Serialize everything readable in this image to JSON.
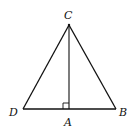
{
  "diagram": {
    "type": "geometry-triangle",
    "points": {
      "C": {
        "label": "C",
        "x": 69,
        "y": 25
      },
      "D": {
        "label": "D",
        "x": 23,
        "y": 109
      },
      "B": {
        "label": "B",
        "x": 116,
        "y": 109
      },
      "A": {
        "label": "A",
        "x": 69,
        "y": 109
      }
    },
    "segments": [
      "CD",
      "CB",
      "DB",
      "CA"
    ],
    "right_angle_at": "A",
    "stroke_color": "#111111"
  }
}
